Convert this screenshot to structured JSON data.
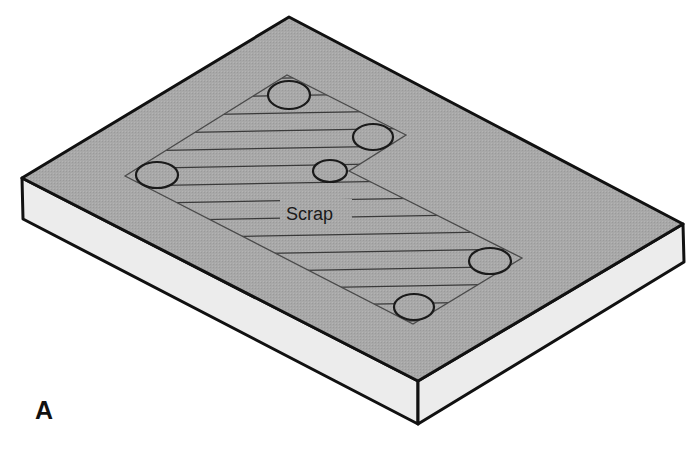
{
  "figure": {
    "panel_label": "A",
    "region_label": "Scrap",
    "colors": {
      "top_face": "#a6a6a6",
      "side_face": "#ececec",
      "edge": "#111111",
      "hatch": "#3a3a3a",
      "hole_stroke": "#1a1a1a"
    },
    "slab": {
      "top_face": [
        [
          22,
          178
        ],
        [
          289,
          17
        ],
        [
          683,
          224
        ],
        [
          418,
          381
        ]
      ],
      "left_face": [
        [
          22,
          178
        ],
        [
          418,
          381
        ],
        [
          418,
          424
        ],
        [
          23,
          219
        ]
      ],
      "right_face": [
        [
          418,
          381
        ],
        [
          683,
          224
        ],
        [
          684,
          262
        ],
        [
          418,
          424
        ]
      ]
    },
    "scrap_region": {
      "outline": [
        [
          125,
          176
        ],
        [
          287,
          75
        ],
        [
          406,
          135
        ],
        [
          349,
          171
        ],
        [
          522,
          258
        ],
        [
          413,
          324
        ]
      ]
    },
    "holes": [
      {
        "cx": 289,
        "cy": 95,
        "rx": 21,
        "ry": 14
      },
      {
        "cx": 373,
        "cy": 137,
        "rx": 20,
        "ry": 13
      },
      {
        "cx": 157,
        "cy": 175,
        "rx": 21,
        "ry": 13
      },
      {
        "cx": 330,
        "cy": 171,
        "rx": 17,
        "ry": 11
      },
      {
        "cx": 490,
        "cy": 261,
        "rx": 21,
        "ry": 13
      },
      {
        "cx": 414,
        "cy": 307,
        "rx": 20,
        "ry": 13
      }
    ]
  }
}
